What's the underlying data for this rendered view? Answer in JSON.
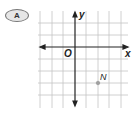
{
  "option_label": "A",
  "axes": {
    "x_label": "x",
    "y_label": "y",
    "origin_label": "O"
  },
  "grid": {
    "cols_left": 3,
    "cols_right": 4,
    "rows_above": 3,
    "rows_below": 5,
    "line_color": "#bdbdbd",
    "axis_color": "#222222"
  },
  "point": {
    "label": "N",
    "x": 2,
    "y": -3,
    "color": "#a0a0a0"
  }
}
